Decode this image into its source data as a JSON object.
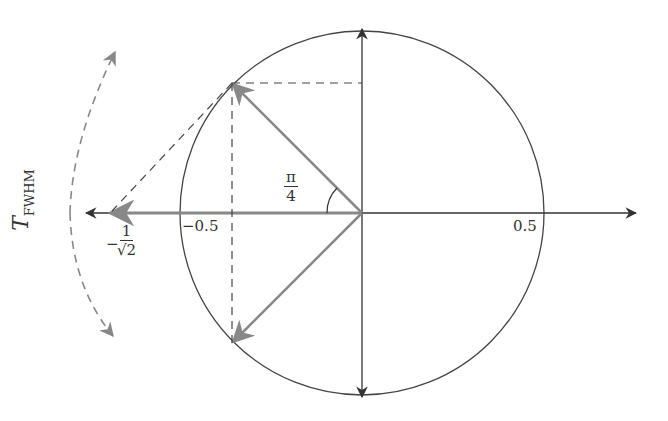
{
  "diagram": {
    "type": "phasor-circle",
    "colors": {
      "axis": "#333333",
      "phasor": "#808080",
      "dashed": "#444444",
      "fwhm_arrow": "#808080"
    },
    "labels": {
      "tick_neg_half": "−0.5",
      "tick_pos_half": "0.5",
      "angle_num": "π",
      "angle_den": "4",
      "neg_sign": "−",
      "inv_sqrt2_num": "1",
      "inv_sqrt2_den": "√2",
      "fwhm_main": "T",
      "fwhm_sub": "FWHM"
    }
  }
}
